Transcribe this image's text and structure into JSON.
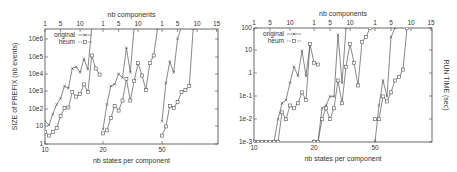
{
  "chart_data": [
    {
      "type": "line",
      "title": "",
      "xlabel": "nb states per component",
      "x2label": "nb components",
      "ylabel": "SIZE of PREFIX (nb events)",
      "yscale": "log",
      "ylim": [
        1,
        4000000
      ],
      "grid": false,
      "legend_position": "top-left inside",
      "x_bottom_ticks": [
        "10",
        "20",
        "50"
      ],
      "x_top_ticks": [
        "1",
        "5",
        "10",
        "1",
        "5",
        "10",
        "1",
        "5",
        "10",
        "15"
      ],
      "y_ticks": [
        "1",
        "10",
        "10e2",
        "10e3",
        "10e4",
        "10e5",
        "10e6"
      ],
      "segments": [
        {
          "states": 10,
          "components": [
            1,
            2,
            3,
            4,
            5,
            6,
            7,
            8,
            9,
            10,
            11,
            12,
            13,
            14,
            15
          ],
          "series": [
            {
              "name": "original",
              "marker": "x",
              "values": [
                20,
                12,
                50,
                180,
                400,
                2000,
                1500,
                20000,
                25000,
                12000,
                70000,
                18000,
                5000000,
                null,
                null
              ]
            },
            {
              "name": "heum",
              "marker": "square",
              "values": [
                5,
                3,
                5,
                8,
                40,
                110,
                120,
                900,
                500,
                700,
                2500,
                900,
                110000,
                20000,
                9000
              ]
            }
          ]
        },
        {
          "states": 20,
          "components": [
            1,
            2,
            3,
            4,
            5,
            6,
            7,
            8,
            9,
            10,
            11,
            12,
            13,
            14,
            15
          ],
          "series": [
            {
              "name": "original",
              "marker": "x",
              "values": [
                7,
                180,
                2000,
                2500,
                10000,
                6000,
                300000,
                12000,
                5000000,
                null,
                null,
                null,
                null,
                null,
                null
              ]
            },
            {
              "name": "heum",
              "marker": "square",
              "values": [
                4,
                6,
                30,
                150,
                80,
                300,
                5000,
                300,
                4000,
                40000,
                8000,
                1200,
                40000,
                110000,
                4000000
              ]
            }
          ]
        },
        {
          "states": 50,
          "components": [
            1,
            2,
            3,
            4,
            5,
            6,
            7,
            8,
            9,
            10,
            11,
            12,
            13,
            14,
            15
          ],
          "series": [
            {
              "name": "original",
              "marker": "x",
              "values": [
                20,
                3000,
                50000,
                12000,
                1000000,
                5000000,
                null,
                null,
                null,
                null,
                null,
                null,
                null,
                null,
                null
              ]
            },
            {
              "name": "heum",
              "marker": "square",
              "values": [
                3,
                10,
                150,
                110,
                250,
                900,
                1200,
                2000,
                4000000,
                null,
                null,
                null,
                null,
                null,
                null
              ]
            }
          ]
        }
      ]
    },
    {
      "type": "line",
      "title": "",
      "xlabel": "nb states per component",
      "x2label": "nb components",
      "ylabel": "RUN TIME (sec)",
      "ylabel_position": "right",
      "yscale": "log",
      "ylim": [
        0.001,
        100
      ],
      "grid": false,
      "legend_position": "top-left inside",
      "x_bottom_ticks": [
        "10",
        "20",
        "50"
      ],
      "x_top_ticks": [
        "1",
        "5",
        "10",
        "1",
        "5",
        "10",
        "1",
        "5",
        "10",
        "15"
      ],
      "y_ticks": [
        "1e-3",
        "1e-2",
        "1e-1",
        "1",
        "10",
        "100"
      ],
      "segments": [
        {
          "states": 10,
          "components": [
            1,
            2,
            3,
            4,
            5,
            6,
            7,
            8,
            9,
            10,
            11,
            12,
            13,
            14,
            15
          ],
          "series": [
            {
              "name": "original",
              "marker": "x",
              "values": [
                0.001,
                0.001,
                0.001,
                0.001,
                0.001,
                0.001,
                0.01,
                0.05,
                0.07,
                0.4,
                2,
                0.8,
                10,
                0.8,
                20
              ]
            },
            {
              "name": "heum",
              "marker": "square",
              "values": [
                0.001,
                0.001,
                0.001,
                0.001,
                0.001,
                0.001,
                0.001,
                0.02,
                0.01,
                0.04,
                0.03,
                0.05,
                0.15,
                0.07,
                20,
                3,
                2.5
              ]
            }
          ]
        },
        {
          "states": 20,
          "components": [
            1,
            2,
            3,
            4,
            5,
            6,
            7,
            8,
            9,
            10,
            11,
            12,
            13,
            14,
            15
          ],
          "series": [
            {
              "name": "original",
              "marker": "x",
              "values": [
                0.001,
                0.001,
                0.03,
                0.04,
                0.1,
                0.1,
                50,
                0.4,
                100,
                null,
                null,
                null,
                null,
                null,
                null
              ]
            },
            {
              "name": "heum",
              "marker": "square",
              "values": [
                0.001,
                0.001,
                0.01,
                0.03,
                0.01,
                0.03,
                0.5,
                0.05,
                2,
                20,
                3,
                0.3,
                25,
                40,
                100
              ]
            }
          ]
        },
        {
          "states": 50,
          "components": [
            1,
            2,
            3,
            4,
            5,
            6,
            7,
            8,
            9,
            10,
            11,
            12,
            13,
            14,
            15
          ],
          "series": [
            {
              "name": "original",
              "marker": "x",
              "values": [
                0.001,
                0.04,
                0.5,
                0.1,
                40,
                100,
                null,
                null,
                null,
                null,
                null,
                null,
                null,
                null,
                null
              ]
            },
            {
              "name": "heum",
              "marker": "square",
              "values": [
                0.01,
                0.01,
                0.1,
                0.06,
                0.15,
                0.5,
                0.7,
                1.5,
                100,
                null,
                null,
                null,
                null,
                null,
                null
              ]
            }
          ]
        }
      ]
    }
  ],
  "left_chart": {
    "top_axis_title": "nb components",
    "bottom_axis_title": "nb states per component",
    "y_axis_title": "SIZE of PREFIX (nb events)",
    "legend": [
      {
        "label": "original",
        "marker": "x"
      },
      {
        "label": "heum",
        "marker": "square"
      }
    ]
  },
  "right_chart": {
    "top_axis_title": "nb components",
    "bottom_axis_title": "nb states per component",
    "y_axis_title": "RUN TIME (sec)",
    "legend": [
      {
        "label": "original",
        "marker": "x"
      },
      {
        "label": "heum",
        "marker": "square"
      }
    ]
  },
  "colors": {
    "line": "#555555",
    "frame": "#444444",
    "text": "#333333"
  }
}
